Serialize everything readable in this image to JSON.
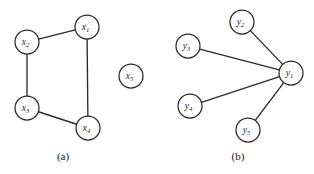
{
  "figure": {
    "width": 314,
    "height": 174,
    "background_color": "#ffffff",
    "stroke_color": "#2b2b2b",
    "node_fill_color": "#ffffff",
    "label_color": "#1a1a1a"
  },
  "panels": [
    {
      "id": "panel-a",
      "caption": "(a)",
      "caption_position": {
        "x": 63,
        "y": 160
      },
      "graph_type": "undirected-graph",
      "node_radius": 12,
      "nodes": [
        {
          "id": "x1",
          "base": "x",
          "sub": "1",
          "cx": 87,
          "cy": 27
        },
        {
          "id": "x2",
          "base": "x",
          "sub": "2",
          "cx": 27,
          "cy": 42
        },
        {
          "id": "x3",
          "base": "x",
          "sub": "3",
          "cx": 27,
          "cy": 108
        },
        {
          "id": "x4",
          "base": "x",
          "sub": "4",
          "cx": 88,
          "cy": 128
        },
        {
          "id": "x5",
          "base": "x",
          "sub": "5",
          "cx": 131,
          "cy": 76
        }
      ],
      "edges": [
        {
          "from": "x1",
          "to": "x2"
        },
        {
          "from": "x2",
          "to": "x3"
        },
        {
          "from": "x3",
          "to": "x4"
        },
        {
          "from": "x4",
          "to": "x1"
        }
      ],
      "isolated_nodes": [
        "x5"
      ]
    },
    {
      "id": "panel-b",
      "caption": "(b)",
      "caption_position": {
        "x": 238,
        "y": 160
      },
      "graph_type": "star-graph",
      "node_radius": 12,
      "nodes": [
        {
          "id": "y1",
          "base": "y",
          "sub": "1",
          "cx": 291,
          "cy": 73
        },
        {
          "id": "y2",
          "base": "y",
          "sub": "2",
          "cx": 242,
          "cy": 22
        },
        {
          "id": "y3",
          "base": "y",
          "sub": "3",
          "cx": 188,
          "cy": 46
        },
        {
          "id": "y4",
          "base": "y",
          "sub": "4",
          "cx": 190,
          "cy": 106
        },
        {
          "id": "y5",
          "base": "y",
          "sub": "5",
          "cx": 248,
          "cy": 130
        }
      ],
      "edges": [
        {
          "from": "y1",
          "to": "y2"
        },
        {
          "from": "y1",
          "to": "y3"
        },
        {
          "from": "y1",
          "to": "y4"
        },
        {
          "from": "y1",
          "to": "y5"
        }
      ],
      "isolated_nodes": []
    }
  ]
}
